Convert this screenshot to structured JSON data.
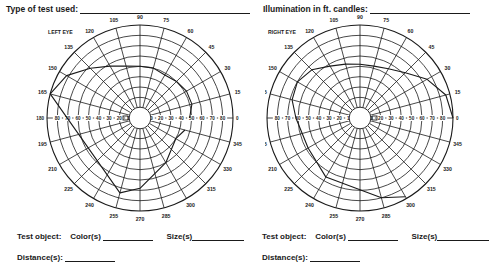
{
  "header": {
    "test_type_label": "Type of test used:",
    "illumination_label": "Illumination in ft. candles:"
  },
  "left_chart": {
    "eye_label": "LEFT EYE",
    "meridian_labels": [
      "0",
      "15",
      "30",
      "45",
      "60",
      "75",
      "90",
      "105",
      "120",
      "135",
      "150",
      "165",
      "180",
      "195",
      "210",
      "225",
      "240",
      "255",
      "270",
      "285",
      "300",
      "315",
      "330",
      "345"
    ],
    "left_axis_labels": [
      "180",
      "80",
      "70",
      "60",
      "50",
      "40",
      "30",
      "20",
      "10"
    ],
    "right_axis_labels": [
      "10",
      "20",
      "30",
      "40",
      "50",
      "60",
      "70",
      "80",
      "0"
    ]
  },
  "right_chart": {
    "eye_label": "RIGHT EYE",
    "meridian_labels": [
      "0",
      "15",
      "30",
      "45",
      "60",
      "75",
      "90",
      "105",
      "120",
      "135",
      "150",
      "165",
      "180",
      "195",
      "210",
      "225",
      "240",
      "255",
      "270",
      "285",
      "300",
      "315",
      "330",
      "345"
    ],
    "left_axis_labels": [
      "180",
      "80",
      "70",
      "60",
      "50",
      "40",
      "30",
      "20",
      "10"
    ],
    "right_axis_labels": [
      "10",
      "20",
      "30",
      "40",
      "50",
      "60",
      "70",
      "80",
      "0"
    ]
  },
  "footer_left": {
    "test_object_label": "Test object:",
    "color_label": "Color(s)",
    "size_label": "Size(s)",
    "distance_label": "Distance(s):"
  },
  "footer_right": {
    "test_object_label": "Test object:",
    "color_label": "Color(s)",
    "size_label": "Size(s)",
    "distance_label": "Distance(s):"
  },
  "chart_data": [
    {
      "type": "polar",
      "title": "LEFT EYE",
      "rings_degrees": [
        10,
        20,
        30,
        40,
        50,
        60,
        70,
        80,
        90
      ],
      "meridians_degrees": [
        0,
        15,
        30,
        45,
        60,
        75,
        90,
        105,
        120,
        135,
        150,
        165,
        180,
        195,
        210,
        225,
        240,
        255,
        270,
        285,
        300,
        315,
        330,
        345
      ],
      "field_boundary": [
        {
          "meridian": 0,
          "eccentricity": 48
        },
        {
          "meridian": 15,
          "eccentricity": 52
        },
        {
          "meridian": 30,
          "eccentricity": 52
        },
        {
          "meridian": 45,
          "eccentricity": 50
        },
        {
          "meridian": 60,
          "eccentricity": 48
        },
        {
          "meridian": 75,
          "eccentricity": 50
        },
        {
          "meridian": 90,
          "eccentricity": 50
        },
        {
          "meridian": 105,
          "eccentricity": 52
        },
        {
          "meridian": 120,
          "eccentricity": 58
        },
        {
          "meridian": 135,
          "eccentricity": 68
        },
        {
          "meridian": 150,
          "eccentricity": 82
        },
        {
          "meridian": 165,
          "eccentricity": 90
        },
        {
          "meridian": 255,
          "eccentricity": 75
        },
        {
          "meridian": 270,
          "eccentricity": 68
        },
        {
          "meridian": 300,
          "eccentricity": 50
        },
        {
          "meridian": 330,
          "eccentricity": 40
        },
        {
          "meridian": 345,
          "eccentricity": 45
        }
      ],
      "blind_spot": {
        "meridian": 180,
        "eccentricity": 14
      }
    },
    {
      "type": "polar",
      "title": "RIGHT EYE",
      "rings_degrees": [
        10,
        20,
        30,
        40,
        50,
        60,
        70,
        80,
        90
      ],
      "meridians_degrees": [
        0,
        15,
        30,
        45,
        60,
        75,
        90,
        105,
        120,
        135,
        150,
        165,
        180,
        195,
        210,
        225,
        240,
        255,
        270,
        285,
        300,
        315,
        330,
        345
      ],
      "field_boundary": [
        {
          "meridian": 0,
          "eccentricity": 90
        },
        {
          "meridian": 15,
          "eccentricity": 86
        },
        {
          "meridian": 30,
          "eccentricity": 75
        },
        {
          "meridian": 45,
          "eccentricity": 62
        },
        {
          "meridian": 60,
          "eccentricity": 55
        },
        {
          "meridian": 75,
          "eccentricity": 52
        },
        {
          "meridian": 90,
          "eccentricity": 52
        },
        {
          "meridian": 105,
          "eccentricity": 54
        },
        {
          "meridian": 120,
          "eccentricity": 58
        },
        {
          "meridian": 135,
          "eccentricity": 66
        },
        {
          "meridian": 150,
          "eccentricity": 70
        },
        {
          "meridian": 165,
          "eccentricity": 68
        },
        {
          "meridian": 180,
          "eccentricity": 62
        },
        {
          "meridian": 210,
          "eccentricity": 58
        },
        {
          "meridian": 240,
          "eccentricity": 66
        },
        {
          "meridian": 285,
          "eccentricity": 80
        },
        {
          "meridian": 300,
          "eccentricity": 88
        }
      ],
      "blind_spot": {
        "meridian": 0,
        "eccentricity": 14
      }
    }
  ]
}
